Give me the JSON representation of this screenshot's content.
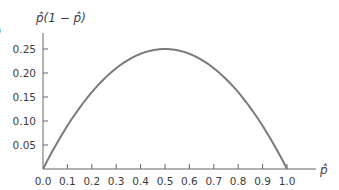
{
  "chart_data": {
    "type": "line",
    "title": "",
    "function": "p̂(1 − p̂)",
    "xlabel": "p̂",
    "ylabel": "p̂(1 − p̂)",
    "xlim": [
      0.0,
      1.0
    ],
    "ylim": [
      0.0,
      0.25
    ],
    "grid": false,
    "legend": null,
    "x_ticks": [
      "0.0",
      "0.1",
      "0.2",
      "0.3",
      "0.4",
      "0.5",
      "0.6",
      "0.7",
      "0.8",
      "0.9",
      "1.0"
    ],
    "y_ticks": [
      "0.05",
      "0.10",
      "0.15",
      "0.20",
      "0.25"
    ],
    "x": [
      0.0,
      0.1,
      0.2,
      0.3,
      0.4,
      0.5,
      0.6,
      0.7,
      0.8,
      0.9,
      1.0
    ],
    "series": [
      {
        "name": "p̂(1 − p̂)",
        "values": [
          0.0,
          0.09,
          0.16,
          0.21,
          0.24,
          0.25,
          0.24,
          0.21,
          0.16,
          0.09,
          0.0
        ],
        "color": "#7a7a7a"
      }
    ],
    "annotations": [],
    "cropped_fragment": ")"
  },
  "colors": {
    "curve": "#7a7a7a",
    "axis": "#666666",
    "text": "#3d3d3d"
  }
}
